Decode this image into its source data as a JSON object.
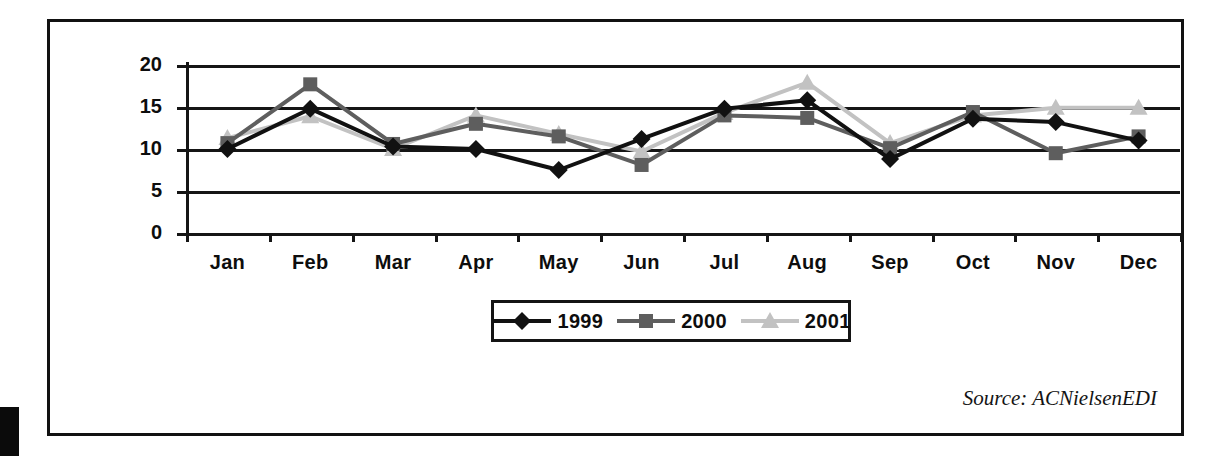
{
  "figure": {
    "source_note": "Source: ACNielsenEDI"
  },
  "legend": {
    "entries": [
      {
        "label": "1999",
        "marker": "diamond-marker",
        "color": "#111111"
      },
      {
        "label": "2000",
        "marker": "square-marker",
        "color": "#5e5e5e"
      },
      {
        "label": "2001",
        "marker": "triangle-marker",
        "color": "#c2c2c2"
      }
    ]
  },
  "chart_data": {
    "type": "line",
    "title": "",
    "xlabel": "",
    "ylabel": "",
    "grid": true,
    "legend_position": "bottom",
    "ylim": [
      0,
      20
    ],
    "yticks": [
      0,
      5,
      10,
      15,
      20
    ],
    "ytick_labels": [
      "0",
      "5",
      "10",
      "15",
      "20"
    ],
    "categories": [
      "Jan",
      "Feb",
      "Mar",
      "Apr",
      "May",
      "Jun",
      "Jul",
      "Aug",
      "Sep",
      "Oct",
      "Nov",
      "Dec"
    ],
    "series": [
      {
        "name": "1999",
        "color": "#111111",
        "marker": "diamond",
        "values": [
          10.0,
          14.8,
          10.3,
          10.0,
          7.5,
          11.2,
          14.8,
          15.8,
          8.8,
          13.6,
          13.2,
          11.0
        ]
      },
      {
        "name": "2000",
        "color": "#5e5e5e",
        "marker": "square",
        "values": [
          10.7,
          17.7,
          10.6,
          13.0,
          11.5,
          8.1,
          14.0,
          13.7,
          10.1,
          14.4,
          9.5,
          11.5
        ]
      },
      {
        "name": "2001",
        "color": "#c2c2c2",
        "marker": "triangle",
        "values": [
          11.3,
          13.9,
          10.0,
          14.0,
          11.8,
          9.7,
          14.3,
          17.9,
          10.7,
          14.0,
          14.9,
          14.9
        ]
      }
    ]
  }
}
